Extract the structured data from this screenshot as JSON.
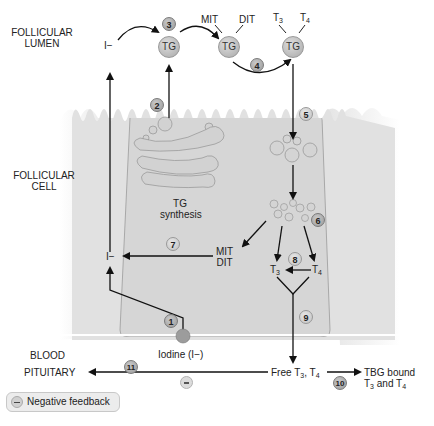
{
  "regions": {
    "follicular_lumen": [
      "FOLLICULAR",
      "LUMEN"
    ],
    "follicular_cell": [
      "FOLLICULAR",
      "CELL"
    ],
    "blood": "BLOOD",
    "pituitary": "PITUITARY"
  },
  "molecules": {
    "iodide_top": "I−",
    "iodide_mid": "I−",
    "tg_1": "TG",
    "tg_2": "TG",
    "tg_3": "TG",
    "mit_top": "MIT",
    "dit_top": "DIT",
    "t3_top": "T",
    "t3_top_sub": "3",
    "t4_top": "T",
    "t4_top_sub": "4",
    "tg_synthesis": [
      "TG",
      "synthesis"
    ],
    "mit_mid": "MIT",
    "dit_mid": "DIT",
    "t3_mid": "T",
    "t3_mid_sub": "3",
    "t4_mid": "T",
    "t4_mid_sub": "4",
    "iodine": "Iodine (I−)",
    "free_t3_t4": {
      "a": "Free T",
      "a_sub": "3",
      "b": ", T",
      "b_sub": "4"
    },
    "tbg_bound": {
      "line1": "TBG bound",
      "line2a": "T",
      "line2a_sub": "3",
      "line2b": " and T",
      "line2b_sub": "4"
    }
  },
  "steps": [
    "1",
    "2",
    "3",
    "4",
    "5",
    "6",
    "7",
    "8",
    "9",
    "10",
    "11"
  ],
  "legend": {
    "negative_feedback": "Negative feedback"
  },
  "colors": {
    "cell_fill": "#d9d9d9",
    "cell_outline": "#9a9a9a",
    "arrow": "#111111",
    "step_circle": "#a8a8a8"
  }
}
